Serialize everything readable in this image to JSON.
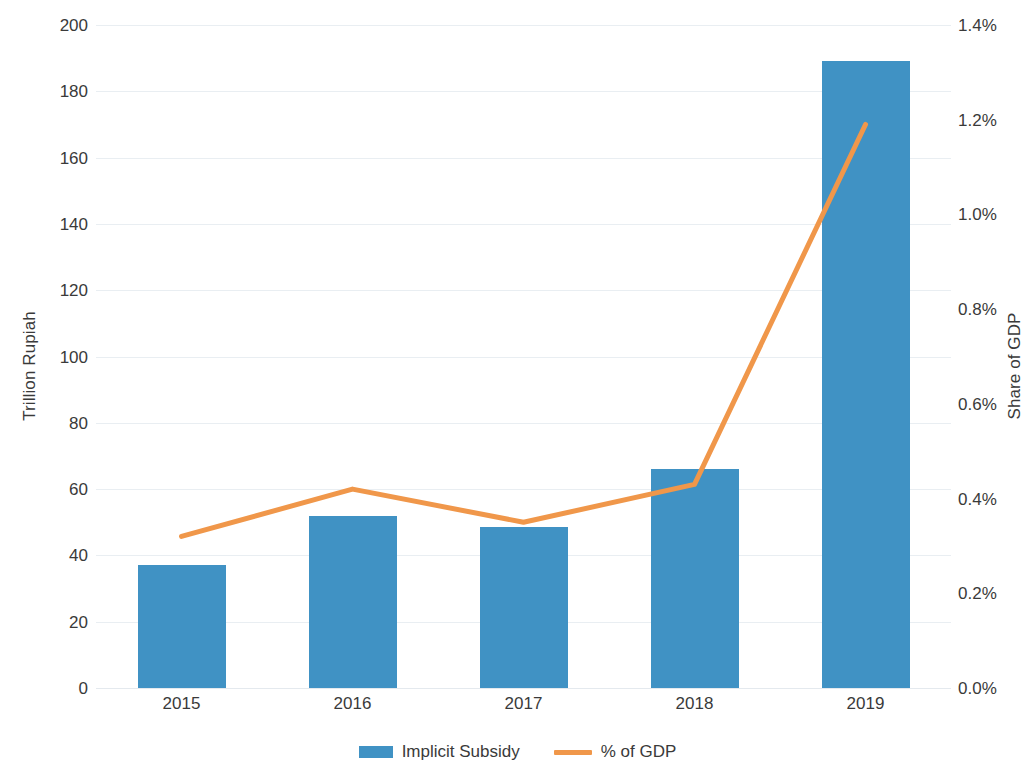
{
  "chart_data": {
    "type": "bar",
    "title": "",
    "categories": [
      "2015",
      "2016",
      "2017",
      "2018",
      "2019"
    ],
    "xlabel": "",
    "ylabel": "Trillion Rupiah",
    "y2label": "Share of GDP",
    "ylim": [
      0,
      200
    ],
    "y2lim": [
      0,
      1.4
    ],
    "grid": true,
    "legend_position": "bottom",
    "series": [
      {
        "name": "Implicit Subsidy",
        "type": "bar",
        "axis": "left",
        "color": "#4092c4",
        "values": [
          37,
          52,
          48.5,
          66,
          189
        ]
      },
      {
        "name": "% of GDP",
        "type": "line",
        "axis": "right",
        "color": "#f0974a",
        "values": [
          0.32,
          0.42,
          0.35,
          0.43,
          1.19
        ]
      }
    ],
    "y_ticks": [
      "0",
      "20",
      "40",
      "60",
      "80",
      "100",
      "120",
      "140",
      "160",
      "180",
      "200"
    ],
    "y_tick_values": [
      0,
      20,
      40,
      60,
      80,
      100,
      120,
      140,
      160,
      180,
      200
    ],
    "y2_ticks": [
      "0.0%",
      "0.2%",
      "0.4%",
      "0.6%",
      "0.8%",
      "1.0%",
      "1.2%",
      "1.4%"
    ],
    "y2_tick_values": [
      0,
      0.2,
      0.4,
      0.6,
      0.8,
      1.0,
      1.2,
      1.4
    ]
  },
  "axes": {
    "left_title": "Trillion Rupiah",
    "right_title": "Share of GDP"
  },
  "legend": {
    "items": [
      {
        "label": "Implicit Subsidy",
        "marker": "bar-swatch",
        "color": "#4092c4"
      },
      {
        "label": "% of GDP",
        "marker": "line-swatch",
        "color": "#f0974a"
      }
    ]
  },
  "colors": {
    "bar": "#4092c4",
    "line": "#f0974a",
    "grid": "#e9eef2",
    "text": "#3a3a3a",
    "background": "#ffffff"
  }
}
